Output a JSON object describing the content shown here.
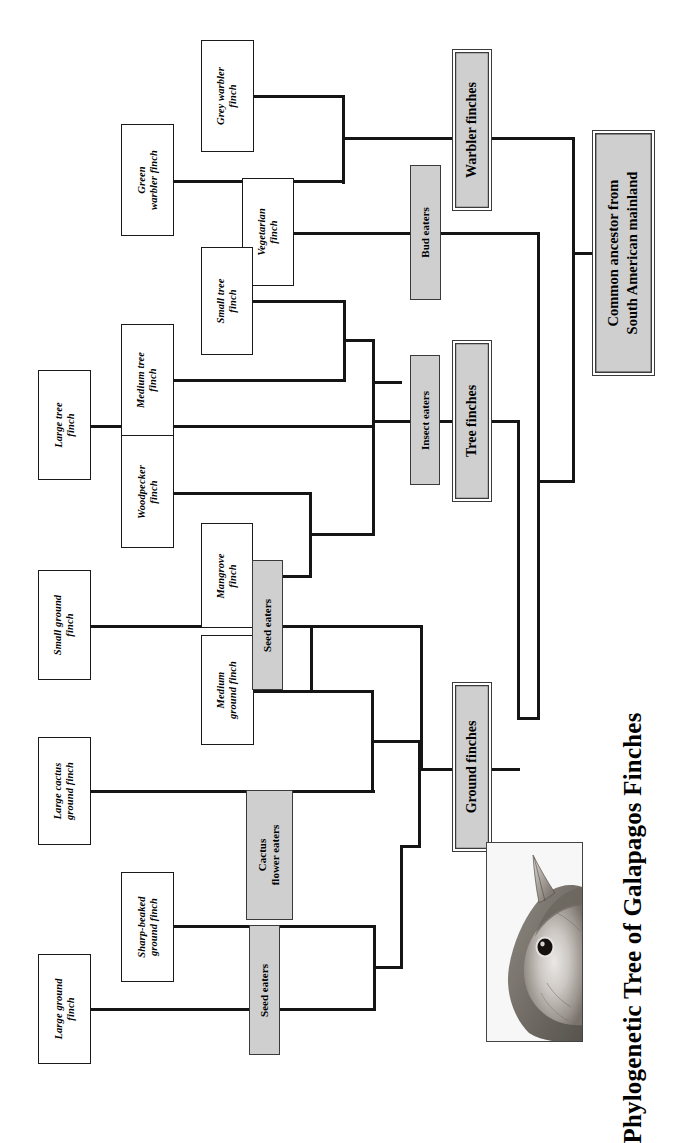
{
  "title": "Phylogenetic Tree of Galapagos Finches",
  "root": {
    "label": "Common ancestor from\nSouth American mainland"
  },
  "groups": [
    {
      "id": "warbler-finches",
      "label": "Warbler finches"
    },
    {
      "id": "tree-finches",
      "label": "Tree finches"
    },
    {
      "id": "ground-finches",
      "label": "Ground finches"
    }
  ],
  "diets": [
    {
      "id": "bud-eaters",
      "label": "Bud eaters"
    },
    {
      "id": "insect-eaters",
      "label": "Insect eaters"
    },
    {
      "id": "seed-eaters-tree",
      "label": "Seed eaters"
    },
    {
      "id": "cactus-flower-eaters",
      "label": "Cactus\nflower eaters"
    },
    {
      "id": "seed-eaters-ground",
      "label": "Seed eaters"
    }
  ],
  "species": [
    {
      "id": "green-warbler-finch",
      "label": "Green\nwarbler finch"
    },
    {
      "id": "grey-warbler-finch",
      "label": "Grey warbler\nfinch"
    },
    {
      "id": "vegetarian-finch",
      "label": "Vegetarian\nfinch"
    },
    {
      "id": "large-tree-finch",
      "label": "Large tree\nfinch"
    },
    {
      "id": "medium-tree-finch",
      "label": "Medium tree\nfinch"
    },
    {
      "id": "small-tree-finch",
      "label": "Small tree\nfinch"
    },
    {
      "id": "woodpecker-finch",
      "label": "Woodpecker\nfinch"
    },
    {
      "id": "mangrove-finch",
      "label": "Mangrove\nfinch"
    },
    {
      "id": "small-ground-finch",
      "label": "Small ground\nfinch"
    },
    {
      "id": "medium-ground-finch",
      "label": "Medium\nground finch"
    },
    {
      "id": "large-cactus-ground-finch",
      "label": "Large cactus\nground finch"
    },
    {
      "id": "sharp-beaked-ground-finch",
      "label": "Sharp-beaked\nground finch"
    },
    {
      "id": "large-ground-finch",
      "label": "Large ground\nfinch"
    }
  ],
  "photo": {
    "caption": "finch-head-photograph"
  },
  "colors": {
    "stroke": "#151515",
    "box_fill_white": "#ffffff",
    "box_fill_grey": "#cfcfcf",
    "border_grey": "#3a3a3a",
    "background": "#ffffff"
  }
}
